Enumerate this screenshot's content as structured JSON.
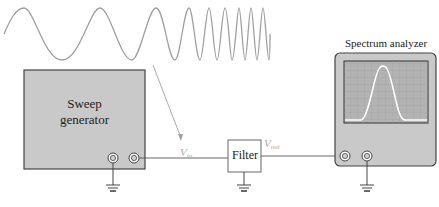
{
  "diagram": {
    "sweep_generator": {
      "label_line1": "Sweep",
      "label_line2": "generator"
    },
    "filter": {
      "label": "Filter"
    },
    "spectrum_analyzer": {
      "label": "Spectrum analyzer"
    },
    "signals": {
      "vin": {
        "main": "V",
        "sub": "in"
      },
      "vout": {
        "main": "V",
        "sub": "out"
      }
    },
    "colors": {
      "instrument_fill": "#c9c9c9",
      "screen_fill": "#b3b3b3",
      "wave": "#a0a0a0",
      "wire": "#555555",
      "signal_label": "#aaaaaa"
    }
  }
}
